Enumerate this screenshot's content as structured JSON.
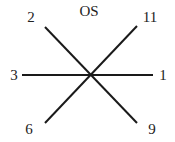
{
  "diagram": {
    "title": "OS",
    "center": [
      91,
      75
    ],
    "line_color": "#1a1a1a",
    "lines": [
      {
        "name": "horizontal-axis",
        "from": [
          22,
          75
        ],
        "to": [
          153,
          75
        ],
        "ends": [
          "3",
          "1"
        ]
      },
      {
        "name": "diagonal-descending",
        "from": [
          45,
          27
        ],
        "to": [
          137,
          123
        ],
        "ends": [
          "2",
          "9"
        ]
      },
      {
        "name": "diagonal-ascending",
        "from": [
          137,
          26
        ],
        "to": [
          45,
          123
        ],
        "ends": [
          "11",
          "6"
        ]
      }
    ],
    "labels": {
      "top_left": "2",
      "top_right": "11",
      "left": "3",
      "right": "1",
      "bottom_left": "6",
      "bottom_right": "9"
    }
  }
}
